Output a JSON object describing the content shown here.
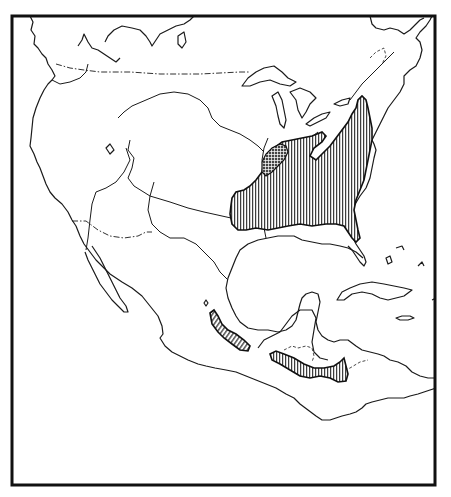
{
  "map": {
    "type": "species range map",
    "region": "North and Central America",
    "colors": {
      "background": "#ffffff",
      "ink": "#111111"
    },
    "frame": {
      "x": 11,
      "y": 15,
      "width": 425,
      "height": 471
    },
    "legend": [],
    "layers": [
      {
        "name": "coastlines",
        "style": "solid line"
      },
      {
        "name": "international-borders",
        "style": "dash-dot line"
      },
      {
        "name": "rivers",
        "style": "solid thin line"
      },
      {
        "name": "main-range-eastern-us",
        "style": "vertical hatching",
        "area": "Eastern United States"
      },
      {
        "name": "core-range-ohio-valley",
        "style": "cross hatching",
        "area": "Lower Ohio River valley"
      },
      {
        "name": "range-mexico",
        "style": "diagonal hatching",
        "area": "Sierra Madre Oriental, Mexico"
      },
      {
        "name": "range-central-america",
        "style": "vertical hatching",
        "area": "Guatemala to Honduras"
      }
    ]
  }
}
